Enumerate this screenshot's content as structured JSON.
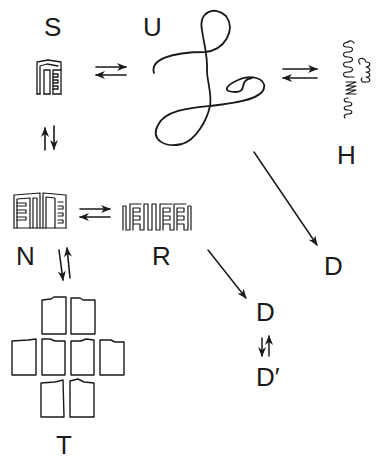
{
  "diagram": {
    "title": "",
    "colors": {
      "ink": "#1a1a1a",
      "background": "#ffffff"
    },
    "states": [
      {
        "id": "S",
        "label": "S",
        "depiction": "compact folded hairpin structure"
      },
      {
        "id": "U",
        "label": "U",
        "depiction": "unfolded random coil chain"
      },
      {
        "id": "H",
        "label": "H",
        "depiction": "helical coiled structure"
      },
      {
        "id": "N",
        "label": "N",
        "depiction": "native folded dimer-like structure"
      },
      {
        "id": "R",
        "label": "R",
        "depiction": "extended hairpin ribbon"
      },
      {
        "id": "D1",
        "label": "D",
        "depiction": "degraded state (from U)"
      },
      {
        "id": "D2",
        "label": "D",
        "depiction": "degraded state (from R)"
      },
      {
        "id": "Dprime",
        "label": "D′",
        "depiction": "alternate degraded state"
      },
      {
        "id": "T",
        "label": "T",
        "depiction": "tiled array of 8 rectangular units"
      }
    ],
    "transitions": [
      {
        "from": "S",
        "to": "U",
        "type": "reversible"
      },
      {
        "from": "U",
        "to": "H",
        "type": "reversible"
      },
      {
        "from": "S",
        "to": "N",
        "type": "reversible"
      },
      {
        "from": "N",
        "to": "R",
        "type": "reversible"
      },
      {
        "from": "N",
        "to": "T",
        "type": "reversible"
      },
      {
        "from": "U",
        "to": "D1",
        "type": "irreversible"
      },
      {
        "from": "R",
        "to": "D2",
        "type": "irreversible"
      },
      {
        "from": "D2",
        "to": "Dprime",
        "type": "reversible"
      }
    ]
  },
  "labels": {
    "S": "S",
    "U": "U",
    "H": "H",
    "N": "N",
    "R": "R",
    "D_upper": "D",
    "D_lower": "D",
    "D_prime": "D′",
    "T": "T"
  }
}
